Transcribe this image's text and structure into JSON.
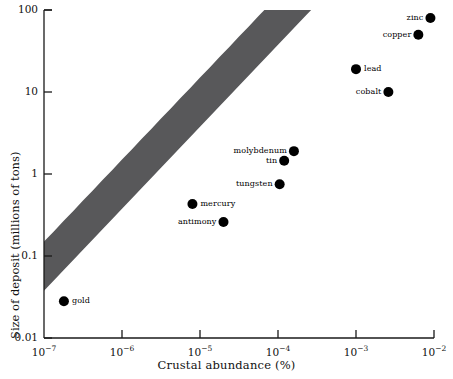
{
  "chart_data": {
    "type": "scatter",
    "title": "",
    "xlabel": "Crustal abundance (%)",
    "ylabel": "Size of deposit (millions of tons)",
    "xscale": "log",
    "yscale": "log",
    "xlim": [
      1e-07,
      0.01
    ],
    "ylim": [
      0.01,
      100
    ],
    "grid": false,
    "legend": "none",
    "xticks": [
      {
        "value": 1e-07,
        "base": "10",
        "exp": "−7"
      },
      {
        "value": 1e-06,
        "base": "10",
        "exp": "−6"
      },
      {
        "value": 1e-05,
        "base": "10",
        "exp": "−5"
      },
      {
        "value": 0.0001,
        "base": "10",
        "exp": "−4"
      },
      {
        "value": 0.001,
        "base": "10",
        "exp": "−3"
      },
      {
        "value": 0.01,
        "base": "10",
        "exp": "−2"
      }
    ],
    "yticks": [
      {
        "value": 100,
        "label": "100"
      },
      {
        "value": 10,
        "label": "10"
      },
      {
        "value": 1,
        "label": "1"
      },
      {
        "value": 0.1,
        "label": "0.1"
      },
      {
        "value": 0.01,
        "label": "0.01"
      }
    ],
    "points": [
      {
        "name": "gold",
        "x": 1.8e-07,
        "y": 0.028,
        "label_side": "right"
      },
      {
        "name": "antimony",
        "x": 2e-05,
        "y": 0.26,
        "label_side": "left"
      },
      {
        "name": "mercury",
        "x": 8e-06,
        "y": 0.43,
        "label_side": "right"
      },
      {
        "name": "tungsten",
        "x": 0.000105,
        "y": 0.75,
        "label_side": "left"
      },
      {
        "name": "tin",
        "x": 0.00012,
        "y": 1.45,
        "label_side": "left"
      },
      {
        "name": "molybdenum",
        "x": 0.00016,
        "y": 1.9,
        "label_side": "left"
      },
      {
        "name": "cobalt",
        "x": 0.0026,
        "y": 10.0,
        "label_side": "left"
      },
      {
        "name": "lead",
        "x": 0.001,
        "y": 19.0,
        "label_side": "right"
      },
      {
        "name": "copper",
        "x": 0.0063,
        "y": 50.0,
        "label_side": "left"
      },
      {
        "name": "zinc",
        "x": 0.009,
        "y": 80.0,
        "label_side": "left"
      }
    ],
    "band": {
      "description": "shaded trend band of constant slope 1 on log-log axes",
      "color": "#58585a"
    },
    "colors": {
      "marker": "#000000",
      "band": "#58585a",
      "axis": "#1a1a1a"
    }
  }
}
